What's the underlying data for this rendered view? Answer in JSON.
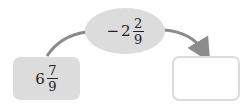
{
  "diagram": {
    "start": {
      "whole": "6",
      "numerator": "7",
      "denominator": "9"
    },
    "operation": {
      "sign": "−",
      "whole": "2",
      "numerator": "2",
      "denominator": "9"
    },
    "result": {
      "value": ""
    },
    "colors": {
      "box_fill": "#dcdcdc",
      "arrow": "#8c8c8c",
      "result_border": "#dcdcdc"
    }
  }
}
